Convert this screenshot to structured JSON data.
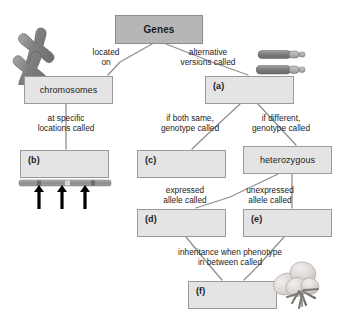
{
  "diagram": {
    "colors": {
      "box_fill_light": "#e4e4e4",
      "box_fill_dark": "#b6b6b6",
      "box_border": "#9a9a9a",
      "connector": "#8f8f8f",
      "text": "#1c1c1c",
      "arrow_black": "#000000",
      "chromosome_gray": "#8a8a8a",
      "background": "#ffffff"
    },
    "nodes": [
      {
        "id": "genes",
        "label": "Genes",
        "style": "dark",
        "x": 115,
        "y": 15,
        "w": 88,
        "h": 29
      },
      {
        "id": "chromosomes",
        "label": "chromosomes",
        "style": "light",
        "x": 24,
        "y": 76,
        "w": 89,
        "h": 28
      },
      {
        "id": "a",
        "label": "(a)",
        "style": "lettered",
        "x": 205,
        "y": 76,
        "w": 89,
        "h": 28
      },
      {
        "id": "b",
        "label": "(b)",
        "style": "lettered",
        "x": 20,
        "y": 150,
        "w": 89,
        "h": 28
      },
      {
        "id": "c",
        "label": "(c)",
        "style": "lettered",
        "x": 137,
        "y": 150,
        "w": 89,
        "h": 28
      },
      {
        "id": "heterozygous",
        "label": "heterozygous",
        "style": "light",
        "x": 243,
        "y": 146,
        "w": 89,
        "h": 28
      },
      {
        "id": "d",
        "label": "(d)",
        "style": "lettered",
        "x": 137,
        "y": 209,
        "w": 89,
        "h": 28
      },
      {
        "id": "e",
        "label": "(e)",
        "style": "lettered",
        "x": 243,
        "y": 209,
        "w": 89,
        "h": 28
      },
      {
        "id": "f",
        "label": "(f)",
        "style": "lettered",
        "x": 188,
        "y": 281,
        "w": 89,
        "h": 28
      }
    ],
    "edge_labels": [
      {
        "id": "located-on",
        "text": "located\non",
        "x": 82,
        "y": 47,
        "w": 48,
        "align": "center"
      },
      {
        "id": "alt-versions",
        "text": "alternative\nversions called",
        "x": 172,
        "y": 47,
        "w": 72,
        "align": "center"
      },
      {
        "id": "at-specific",
        "text": "at specific\nlocations called",
        "x": 24,
        "y": 113,
        "w": 84,
        "align": "center"
      },
      {
        "id": "if-both-same",
        "text": "if both same,\ngenotype called",
        "x": 152,
        "y": 113,
        "w": 76,
        "align": "center"
      },
      {
        "id": "if-different",
        "text": "if different,\ngenotype called",
        "x": 243,
        "y": 113,
        "w": 76,
        "align": "center"
      },
      {
        "id": "expressed-allele",
        "text": "expressed\nallele called",
        "x": 152,
        "y": 185,
        "w": 66,
        "align": "center"
      },
      {
        "id": "unexpressed-allele",
        "text": "unexpressed\nallele called",
        "x": 234,
        "y": 185,
        "w": 72,
        "align": "center"
      },
      {
        "id": "inheritance",
        "text": "inheritance when phenotype\nin between called",
        "x": 150,
        "y": 247,
        "w": 160,
        "align": "center"
      }
    ],
    "connectors": [
      {
        "from": "genes",
        "to": "chromosomes",
        "path": "M 152 44 L 120 62 L 108 75"
      },
      {
        "from": "genes",
        "to": "a",
        "path": "M 166 44 L 212 62 L 248 75"
      },
      {
        "from": "chromosomes",
        "to": "b",
        "path": "M 66 104 L 66 149"
      },
      {
        "from": "a",
        "to": "c",
        "path": "M 240 104 L 212 130 L 192 149"
      },
      {
        "from": "a",
        "to": "heterozygous",
        "path": "M 258 104 L 282 130 L 296 145"
      },
      {
        "from": "heterozygous",
        "to": "d",
        "path": "M 278 174 L 230 197 L 196 208"
      },
      {
        "from": "heterozygous",
        "to": "e",
        "path": "M 292 174 L 292 208"
      },
      {
        "from": "d",
        "to": "f",
        "path": "M 186 237 L 210 266 L 222 280"
      },
      {
        "from": "e",
        "to": "f",
        "path": "M 284 237 L 258 266 L 244 280"
      }
    ],
    "illustrations": [
      {
        "id": "chromosome-pair-x",
        "description": "two X-shaped chromosomes",
        "x": 8,
        "y": 27,
        "w": 62,
        "h": 55
      },
      {
        "id": "chromosome-pair-linear",
        "description": "two linear allele chromosomes",
        "x": 258,
        "y": 49,
        "w": 88,
        "h": 33
      },
      {
        "id": "gene-locus-bar",
        "description": "chromosome bar with three loci arrows",
        "x": 20,
        "y": 179,
        "w": 92,
        "h": 30
      },
      {
        "id": "pink-flower",
        "description": "rosebud flower phenotype",
        "x": 268,
        "y": 262,
        "w": 60,
        "h": 52
      }
    ]
  }
}
